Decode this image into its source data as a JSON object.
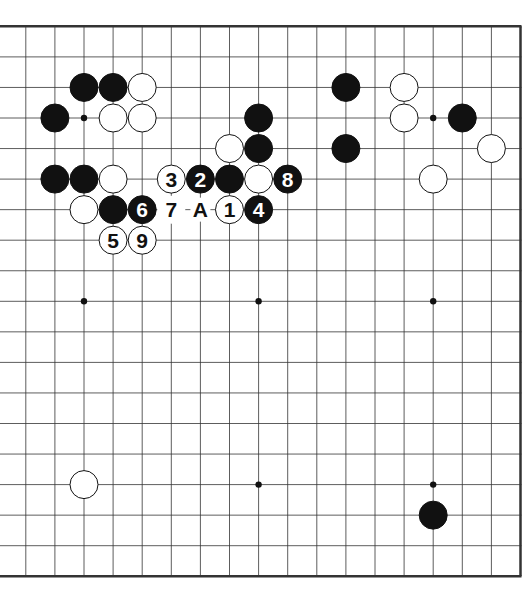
{
  "diagram": {
    "type": "go-board",
    "size": 19,
    "visible_columns_from": 1,
    "colors": {
      "line": "#333333",
      "black": "#111111",
      "white": "#ffffff",
      "border": "#222222"
    },
    "hoshi": [
      [
        3,
        3
      ],
      [
        9,
        3
      ],
      [
        15,
        3
      ],
      [
        3,
        9
      ],
      [
        9,
        9
      ],
      [
        15,
        9
      ],
      [
        3,
        15
      ],
      [
        9,
        15
      ],
      [
        15,
        15
      ]
    ],
    "stones": [
      {
        "c": 3,
        "r": 2,
        "color": "black"
      },
      {
        "c": 4,
        "r": 2,
        "color": "black"
      },
      {
        "c": 5,
        "r": 2,
        "color": "white"
      },
      {
        "c": 2,
        "r": 3,
        "color": "black"
      },
      {
        "c": 4,
        "r": 3,
        "color": "white"
      },
      {
        "c": 5,
        "r": 3,
        "color": "white"
      },
      {
        "c": 9,
        "r": 3,
        "color": "black"
      },
      {
        "c": 8,
        "r": 4,
        "color": "white"
      },
      {
        "c": 9,
        "r": 4,
        "color": "black"
      },
      {
        "c": 2,
        "r": 5,
        "color": "black"
      },
      {
        "c": 3,
        "r": 5,
        "color": "black"
      },
      {
        "c": 4,
        "r": 5,
        "color": "white"
      },
      {
        "c": 8,
        "r": 5,
        "color": "black"
      },
      {
        "c": 9,
        "r": 5,
        "color": "white"
      },
      {
        "c": 3,
        "r": 6,
        "color": "white"
      },
      {
        "c": 4,
        "r": 6,
        "color": "black"
      },
      {
        "c": 12,
        "r": 2,
        "color": "black"
      },
      {
        "c": 14,
        "r": 2,
        "color": "white"
      },
      {
        "c": 14,
        "r": 3,
        "color": "white"
      },
      {
        "c": 16,
        "r": 3,
        "color": "black"
      },
      {
        "c": 12,
        "r": 4,
        "color": "black"
      },
      {
        "c": 17,
        "r": 4,
        "color": "white"
      },
      {
        "c": 15,
        "r": 5,
        "color": "white"
      },
      {
        "c": 3,
        "r": 15,
        "color": "white"
      },
      {
        "c": 15,
        "r": 16,
        "color": "black"
      }
    ],
    "moves": [
      {
        "label": "1",
        "c": 8,
        "r": 6,
        "color": "white"
      },
      {
        "label": "2",
        "c": 7,
        "r": 5,
        "color": "black"
      },
      {
        "label": "3",
        "c": 6,
        "r": 5,
        "color": "white"
      },
      {
        "label": "4",
        "c": 9,
        "r": 6,
        "color": "black"
      },
      {
        "label": "5",
        "c": 4,
        "r": 7,
        "color": "white"
      },
      {
        "label": "6",
        "c": 5,
        "r": 6,
        "color": "black"
      },
      {
        "label": "7",
        "c": 6,
        "r": 6,
        "color": "none"
      },
      {
        "label": "8",
        "c": 10,
        "r": 5,
        "color": "black"
      },
      {
        "label": "9",
        "c": 5,
        "r": 7,
        "color": "white"
      }
    ],
    "markers": [
      {
        "label": "A",
        "c": 7,
        "r": 6
      }
    ]
  }
}
